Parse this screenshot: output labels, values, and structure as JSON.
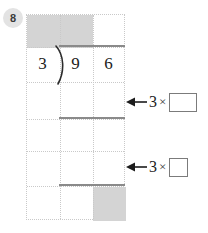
{
  "worksheet": {
    "question_number": "8",
    "type": "long-division-grid",
    "colors": {
      "shade": "#d4d4d4",
      "gridline": "#c9c9c9",
      "rule": "#8a8a8a",
      "badge_bg": "#e3e3e3",
      "ink": "#1c1c1c"
    }
  },
  "division": {
    "divisor": "3",
    "dividend_digits": [
      "9",
      "6"
    ],
    "bracket_glyph": ")",
    "quotient_digits": [
      "",
      ""
    ]
  },
  "grid": {
    "columns": 3,
    "rows": 6,
    "shaded_cells": [
      {
        "row": 1,
        "col": 2,
        "purpose": "quotient-tens"
      },
      {
        "row": 1,
        "col": 3,
        "purpose": "quotient-ones"
      },
      {
        "row": 6,
        "col": 3,
        "purpose": "remainder"
      }
    ]
  },
  "annotations": [
    {
      "id": "annot-1",
      "arrow": "left-arrow-icon",
      "multiplier": "3",
      "operator": "×",
      "box_value": "",
      "box_shape": "wide"
    },
    {
      "id": "annot-2",
      "arrow": "left-arrow-icon",
      "multiplier": "3",
      "operator": "×",
      "box_value": "",
      "box_shape": "square"
    }
  ]
}
